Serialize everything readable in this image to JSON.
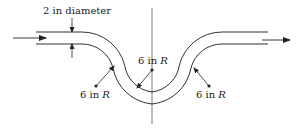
{
  "diagram": {
    "type": "pipe-bend",
    "labels": {
      "diameter": "2 in diameter",
      "radius_left_num": "6 in ",
      "radius_mid_num": "6 in ",
      "radius_right_num": "6 in ",
      "radius_symbol": "R"
    },
    "flow_direction": "left-to-right",
    "line_color": "#333333"
  }
}
